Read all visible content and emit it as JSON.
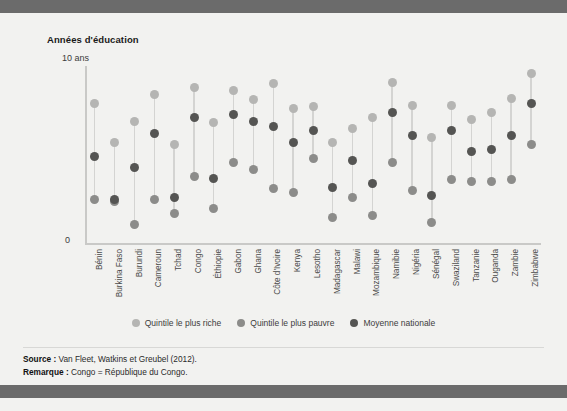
{
  "chart_data": {
    "type": "scatter",
    "title": "Années d'éducation",
    "ylabel": "Années d'éducation",
    "xlabel": "",
    "ylim": [
      0,
      10
    ],
    "ytick_labels": [
      "0",
      "10 ans"
    ],
    "grid": false,
    "legend_position": "bottom",
    "categories": [
      "Bénin",
      "Burkina Faso",
      "Burundi",
      "Cameroun",
      "Tchad",
      "Congo",
      "Éthiopie",
      "Gabon",
      "Ghana",
      "Côte d'Ivoire",
      "Kenya",
      "Lesotho",
      "Madagascar",
      "Malawi",
      "Mozambique",
      "Namibie",
      "Nigéria",
      "Sénégal",
      "Swaziland",
      "Tanzanie",
      "Ouganda",
      "Zambie",
      "Zimbabwe"
    ],
    "series": [
      {
        "name": "Quintile le plus riche",
        "color": "#b5b5b3",
        "values": [
          7.9,
          5.7,
          6.9,
          8.4,
          5.6,
          8.8,
          6.8,
          8.6,
          8.1,
          9.0,
          7.6,
          7.7,
          5.7,
          6.5,
          7.1,
          9.1,
          7.8,
          6.0,
          7.8,
          7.0,
          7.4,
          8.2,
          9.6
        ]
      },
      {
        "name": "Quintile le plus pauvre",
        "color": "#8c8c8a",
        "values": [
          2.5,
          2.4,
          1.1,
          2.5,
          1.7,
          3.8,
          2.0,
          4.6,
          4.2,
          3.1,
          2.9,
          4.8,
          1.5,
          2.6,
          1.6,
          4.6,
          3.0,
          1.2,
          3.6,
          3.5,
          3.5,
          3.6,
          5.6
        ]
      },
      {
        "name": "Moyenne nationale",
        "color": "#555553",
        "values": [
          4.9,
          2.5,
          4.3,
          6.2,
          2.6,
          7.1,
          3.7,
          7.3,
          6.9,
          6.6,
          5.7,
          6.4,
          3.2,
          4.7,
          3.4,
          7.4,
          6.1,
          2.7,
          6.4,
          5.2,
          5.3,
          6.1,
          7.9
        ]
      }
    ]
  },
  "header": {
    "top_band": "",
    "bottom_band": ""
  },
  "axis": {
    "y_title": "Années d'éducation",
    "y_max_label": "10 ans",
    "y_min_label": "0"
  },
  "legend": {
    "items": [
      {
        "label": "Quintile le plus riche",
        "color": "#b5b5b3"
      },
      {
        "label": "Quintile le plus pauvre",
        "color": "#8c8c8a"
      },
      {
        "label": "Moyenne nationale",
        "color": "#555553"
      }
    ]
  },
  "notes": {
    "source_label": "Source :",
    "source_text": " Van Fleet, Watkins et Greubel (2012).",
    "remark_label": "Remarque :",
    "remark_text": " Congo = République du Congo."
  }
}
